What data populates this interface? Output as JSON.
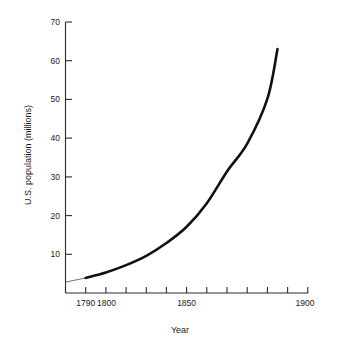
{
  "chart_data": {
    "type": "line",
    "title": "",
    "xlabel": "Year",
    "ylabel": "U.S. population (millions)",
    "xlim": [
      1780,
      1900
    ],
    "ylim": [
      0,
      70
    ],
    "grid": false,
    "legend": "none",
    "x_ticks": [
      1780,
      1790,
      1800,
      1810,
      1820,
      1830,
      1840,
      1850,
      1860,
      1870,
      1880,
      1890,
      1900
    ],
    "x_tick_labels": [
      "",
      "1790",
      "1800",
      "",
      "",
      "",
      "",
      "1850",
      "",
      "",
      "",
      "",
      "1900"
    ],
    "y_ticks": [
      10,
      20,
      30,
      40,
      50,
      60,
      70
    ],
    "y_tick_labels": [
      "10",
      "20",
      "30",
      "40",
      "50",
      "60",
      "70"
    ],
    "series": [
      {
        "name": "U.S. population",
        "style": "solid-thick",
        "x": [
          1790,
          1800,
          1810,
          1820,
          1830,
          1840,
          1850,
          1860,
          1870,
          1880,
          1885
        ],
        "values": [
          3.9,
          5.3,
          7.2,
          9.6,
          12.9,
          17.1,
          23.2,
          31.4,
          38.6,
          50.2,
          63.0
        ]
      },
      {
        "name": "extrapolation",
        "style": "thin",
        "x": [
          1780,
          1790
        ],
        "values": [
          2.8,
          3.9
        ]
      }
    ]
  },
  "axes": {
    "x_title": "Year",
    "y_title": "U.S. population (millions)"
  }
}
